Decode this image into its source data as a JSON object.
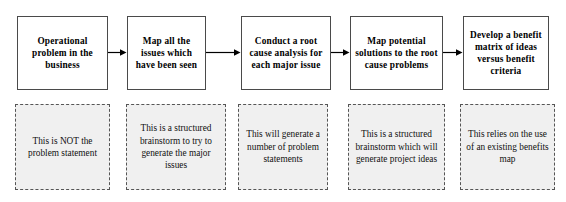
{
  "diagram": {
    "orientation": "left-to-right",
    "colors": {
      "step_border": "#4a4a4a",
      "step_fill": "#ffffff",
      "note_border": "#555555",
      "note_fill": "#f0f0f0",
      "arrow": "#000000",
      "text": "#000000"
    },
    "steps": [
      {
        "id": "step-1",
        "label": "Operational problem in the business",
        "note": "This is NOT the problem statement"
      },
      {
        "id": "step-2",
        "label": "Map all the issues which have been seen",
        "note": "This is a structured brainstorm to try to generate the major issues"
      },
      {
        "id": "step-3",
        "label": "Conduct a root cause analysis for each major issue",
        "note": "This will generate a number of problem statements"
      },
      {
        "id": "step-4",
        "label": "Map potential solutions to the root cause problems",
        "note": "This is a structured brainstorm which will generate project ideas"
      },
      {
        "id": "step-5",
        "label": "Develop a benefit matrix of ideas versus benefit criteria",
        "note": "This relies on the use of an existing benefits map"
      }
    ],
    "connectors": [
      {
        "id": "arrow-1",
        "from": "step-1",
        "to": "step-2",
        "glyph": "arrow-right-icon"
      },
      {
        "id": "arrow-2",
        "from": "step-2",
        "to": "step-3",
        "glyph": "arrow-right-icon"
      },
      {
        "id": "arrow-3",
        "from": "step-3",
        "to": "step-4",
        "glyph": "arrow-right-icon"
      },
      {
        "id": "arrow-4",
        "from": "step-4",
        "to": "step-5",
        "glyph": "arrow-right-icon"
      }
    ]
  }
}
